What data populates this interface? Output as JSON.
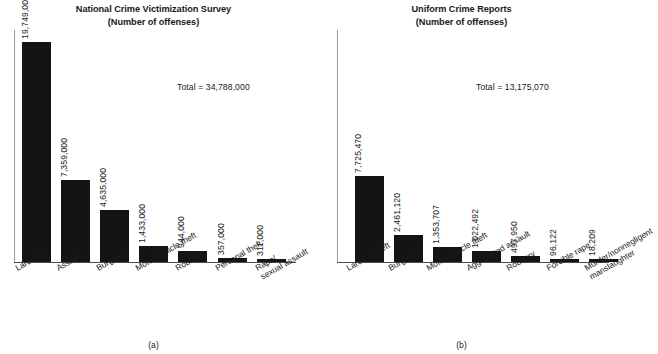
{
  "figure": {
    "caption_a": "(a)",
    "caption_b": "(b)"
  },
  "chart_data": [
    {
      "type": "bar",
      "panel": "(a)",
      "title": "National Crime Victimization Survey",
      "subtitle": "(Number of offenses)",
      "total_label": "Total = 34,788,000",
      "total": 34788000,
      "xlabel": "",
      "ylabel": "",
      "ylim": [
        0,
        20800000
      ],
      "grid": false,
      "legend": "none",
      "categories": [
        "Larceny",
        "Assault",
        "Burglary",
        "Motor vehicle theft",
        "Robbery",
        "Personal theft",
        "Rape/\nsexual assault"
      ],
      "category_lines": [
        [
          "Larceny"
        ],
        [
          "Assault"
        ],
        [
          "Burglary"
        ],
        [
          "Motor vehicle theft"
        ],
        [
          "Robbery"
        ],
        [
          "Personal theft"
        ],
        [
          "Rape/",
          "sexual assault"
        ]
      ],
      "values": [
        19749000,
        7359000,
        4635000,
        1433000,
        944000,
        357000,
        311000
      ],
      "value_labels": [
        "19,749,000",
        "7,359,000",
        "4,635,000",
        "1,433,000",
        "944,000",
        "357,000",
        "311,000"
      ]
    },
    {
      "type": "bar",
      "panel": "(b)",
      "title": "Uniform Crime Reports",
      "subtitle": "(Number of offenses)",
      "total_label": "Total = 13,175,070",
      "total": 13175070,
      "xlabel": "",
      "ylabel": "",
      "ylim": [
        0,
        20800000
      ],
      "grid": false,
      "legend": "none",
      "categories": [
        "Larceny/theft",
        "Burglary",
        "Motor vehicle theft",
        "Aggravated assault",
        "Robbery",
        "Forcible rape",
        "Murder/nonnegligent\nmanslaughter"
      ],
      "category_lines": [
        [
          "Larceny/theft"
        ],
        [
          "Burglary"
        ],
        [
          "Motor vehicle theft"
        ],
        [
          "Aggravated assault"
        ],
        [
          "Robbery"
        ],
        [
          "Forcible rape"
        ],
        [
          "Murder/nonnegligent",
          "manslaughter"
        ]
      ],
      "values": [
        7725470,
        2461120,
        1353707,
        1022492,
        497950,
        96122,
        18209
      ],
      "value_labels": [
        "7,725,470",
        "2,461,120",
        "1,353,707",
        "1,022,492",
        "497,950",
        "96,122",
        "18,209"
      ]
    }
  ],
  "style": {
    "bar_color": "#141414",
    "axis_color": "#4a4a4a",
    "text_color": "#1a1a1a",
    "background": "#ffffff"
  }
}
